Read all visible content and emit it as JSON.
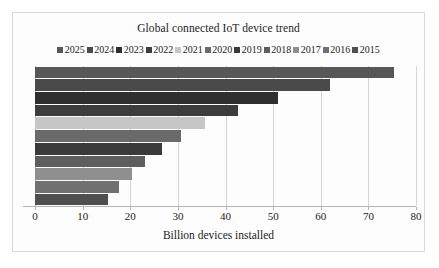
{
  "chart_data": {
    "type": "bar",
    "orientation": "horizontal",
    "title": "Global connected IoT device trend",
    "xlabel": "Billion devices installed",
    "ylabel": "",
    "xlim": [
      0,
      80
    ],
    "xticks": [
      0,
      10,
      20,
      30,
      40,
      50,
      60,
      70,
      80
    ],
    "xticklabels": [
      "0",
      "10",
      "20",
      "30",
      "40",
      "50",
      "60",
      "70",
      "80"
    ],
    "grid": true,
    "legend_position": "top",
    "categories": [
      "2025",
      "2024",
      "2023",
      "2022",
      "2021",
      "2020",
      "2019",
      "2018",
      "2017",
      "2016",
      "2015"
    ],
    "values": [
      75.4,
      62.0,
      51.0,
      42.6,
      35.8,
      30.7,
      26.7,
      23.1,
      20.4,
      17.7,
      15.4
    ],
    "colors": [
      "#575757",
      "#4a4a4a",
      "#2f2f2f",
      "#3d3d3d",
      "#c6c6c6",
      "#6a6a6a",
      "#3a3a3a",
      "#5e5e5e",
      "#8f8f8f",
      "#707070",
      "#4f4f4f"
    ],
    "series": [
      {
        "name": "2025",
        "value": 75.4,
        "color": "#575757"
      },
      {
        "name": "2024",
        "value": 62.0,
        "color": "#4a4a4a"
      },
      {
        "name": "2023",
        "value": 51.0,
        "color": "#2f2f2f"
      },
      {
        "name": "2022",
        "value": 42.6,
        "color": "#3d3d3d"
      },
      {
        "name": "2021",
        "value": 35.8,
        "color": "#c6c6c6"
      },
      {
        "name": "2020",
        "value": 30.7,
        "color": "#6a6a6a"
      },
      {
        "name": "2019",
        "value": 26.7,
        "color": "#3a3a3a"
      },
      {
        "name": "2018",
        "value": 23.1,
        "color": "#5e5e5e"
      },
      {
        "name": "2017",
        "value": 20.4,
        "color": "#8f8f8f"
      },
      {
        "name": "2016",
        "value": 17.7,
        "color": "#707070"
      },
      {
        "name": "2015",
        "value": 15.4,
        "color": "#4f4f4f"
      }
    ]
  },
  "legend": {
    "items": [
      {
        "label": "2025",
        "color": "#575757"
      },
      {
        "label": "2024",
        "color": "#4a4a4a"
      },
      {
        "label": "2023",
        "color": "#2f2f2f"
      },
      {
        "label": "2022",
        "color": "#3d3d3d"
      },
      {
        "label": "2021",
        "color": "#c6c6c6"
      },
      {
        "label": "2020",
        "color": "#6a6a6a"
      },
      {
        "label": "2019",
        "color": "#3a3a3a"
      },
      {
        "label": "2018",
        "color": "#5e5e5e"
      },
      {
        "label": "2017",
        "color": "#8f8f8f"
      },
      {
        "label": "2016",
        "color": "#707070"
      },
      {
        "label": "2015",
        "color": "#4f4f4f"
      }
    ]
  }
}
